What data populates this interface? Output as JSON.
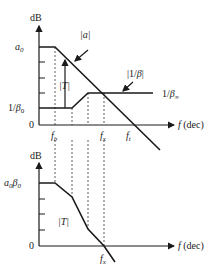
{
  "top_plot": {
    "y_axis_label": "dB",
    "x_axis_label": "f (dec)",
    "y_ticks": {
      "a0": "a0",
      "inv_beta0": "1/β0",
      "zero": "0"
    },
    "x_ticks": {
      "fb": "fb",
      "fx": "fx",
      "ft": "ft"
    },
    "curves": {
      "a": "|a|",
      "inv_beta": "|1/β|",
      "T": "|T|"
    },
    "inv_beta_inf": "1/β∞"
  },
  "bottom_plot": {
    "y_axis_label": "dB",
    "x_axis_label": "f (dec)",
    "y_ticks": {
      "a0beta0": "a0β0",
      "zero": "0"
    },
    "x_ticks": {
      "fx": "fx"
    },
    "curves": {
      "T": "|T|"
    }
  }
}
